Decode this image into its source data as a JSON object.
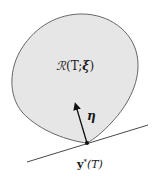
{
  "diagram": {
    "region_label": "ℛ(T;ξ)",
    "region_label_parts": {
      "calligraphic": "ℛ",
      "rest": "(T;",
      "xi": "ξ",
      "close": ")"
    },
    "normal_label": "η",
    "point_label_main": "y",
    "point_label_sup": "*",
    "point_label_rest": "(T)",
    "colors": {
      "region_fill": "#e6e6e6",
      "region_stroke": "#666666",
      "line": "#333333",
      "arrow": "#111111",
      "point": "#111111"
    }
  }
}
